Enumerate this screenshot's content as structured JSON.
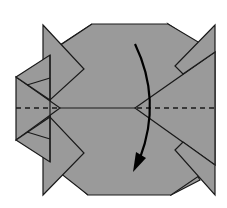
{
  "diagram": {
    "type": "origami-folding-step",
    "colors": {
      "paper": "#9a9a9a",
      "line": "#1a1a1a",
      "arrow": "#000000",
      "background": "#ffffff"
    },
    "elements": [
      {
        "name": "folded-paper-model",
        "description": "Grey folded origami base with four pointed flaps at the corners"
      },
      {
        "name": "valley-fold-line",
        "description": "Horizontal dashed line across the middle"
      },
      {
        "name": "fold-arrow",
        "description": "Curved arrow pointing downward indicating folding the top half down"
      }
    ]
  }
}
